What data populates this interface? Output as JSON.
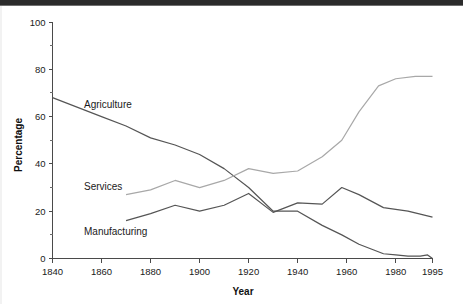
{
  "chart_data": {
    "type": "line",
    "title": "",
    "xlabel": "Year",
    "ylabel": "Percentage",
    "xlim": [
      1840,
      1995
    ],
    "ylim": [
      0,
      100
    ],
    "grid": false,
    "legend_position": "inline-labels",
    "y_ticks_major": [
      0,
      20,
      40,
      60,
      80,
      100
    ],
    "y_ticks_minor": [
      10,
      30,
      50,
      70,
      90
    ],
    "x_ticks_major": [
      1840,
      1860,
      1880,
      1900,
      1920,
      1940,
      1960,
      1980,
      1995
    ],
    "x_tick_labels": [
      "1840",
      "1860",
      "1880",
      "1900",
      "1920",
      "1940",
      "1960",
      "1980",
      "1995"
    ],
    "y_tick_labels": [
      "0",
      "20",
      "40",
      "60",
      "80",
      "100"
    ],
    "series": [
      {
        "name": "Agriculture",
        "color": "#555555",
        "label_text": "Agriculture",
        "x": [
          1840,
          1860,
          1870,
          1880,
          1890,
          1900,
          1910,
          1920,
          1930,
          1940,
          1950,
          1958,
          1965,
          1970,
          1975,
          1980,
          1985,
          1990,
          1993,
          1995
        ],
        "y": [
          68,
          60,
          56,
          51,
          48,
          44,
          38,
          30,
          20,
          20,
          14,
          10,
          6,
          4,
          2,
          1.5,
          1,
          1,
          1.5,
          0
        ]
      },
      {
        "name": "Services",
        "color": "#a8a8a8",
        "label_text": "Services",
        "x": [
          1870,
          1880,
          1890,
          1900,
          1910,
          1920,
          1930,
          1940,
          1950,
          1958,
          1965,
          1973,
          1980,
          1988,
          1995
        ],
        "y": [
          27,
          29,
          33,
          30,
          33,
          38,
          36,
          37,
          43,
          50,
          62,
          73,
          76,
          77,
          77
        ]
      },
      {
        "name": "Manufacturing",
        "color": "#555555",
        "label_text": "Manufacturing",
        "x": [
          1870,
          1880,
          1890,
          1900,
          1910,
          1920,
          1930,
          1940,
          1950,
          1958,
          1965,
          1975,
          1985,
          1995
        ],
        "y": [
          16,
          19,
          22.5,
          20,
          22.5,
          27.5,
          19.5,
          23.5,
          23,
          30,
          27,
          21.5,
          20,
          17.5
        ]
      }
    ]
  },
  "axis": {
    "y_title": "Percentage",
    "x_title": "Year"
  },
  "labels": {
    "agriculture": "Agriculture",
    "services": "Services",
    "manufacturing": "Manufacturing"
  }
}
